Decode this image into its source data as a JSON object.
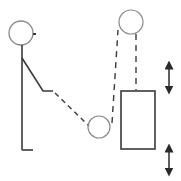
{
  "diagram": {
    "title": "Person pulling rope over pulleys to lift a box",
    "colors": {
      "background": "#ffffff",
      "stroke": "#3a3a3a",
      "circle_stroke": "#8a8a8a"
    },
    "elements": {
      "person": {
        "head": {
          "cx": 21,
          "cy": 33,
          "r": 12
        },
        "nose": {
          "x1": 33,
          "y1": 34,
          "x2": 36,
          "y2": 34
        },
        "body": {
          "x": 22,
          "y1": 45,
          "y2": 150
        },
        "foot": {
          "x1": 22,
          "x2": 33,
          "y": 150
        },
        "arm": {
          "points": "22,58 43,91 53,91"
        }
      },
      "rope_segments": [
        {
          "name": "hand-to-lower-pulley",
          "x1": 55,
          "y1": 93,
          "x2": 89,
          "y2": 126
        },
        {
          "name": "lower-pulley-to-upper-pulley",
          "x1": 112,
          "y1": 123,
          "x2": 118,
          "y2": 30
        },
        {
          "name": "upper-pulley-to-box",
          "x1": 136,
          "y1": 34,
          "x2": 136,
          "y2": 90
        }
      ],
      "lower_pulley": {
        "cx": 99,
        "cy": 127,
        "r": 11
      },
      "upper_pulley": {
        "cx": 131,
        "cy": 22,
        "r": 12
      },
      "box": {
        "x": 121,
        "y": 91,
        "width": 34,
        "height": 58
      },
      "arrows": [
        {
          "name": "upper-double-arrow",
          "x": 169,
          "y1": 65,
          "y2": 90
        },
        {
          "name": "lower-double-arrow",
          "x": 169,
          "y1": 148,
          "y2": 172
        }
      ]
    }
  }
}
